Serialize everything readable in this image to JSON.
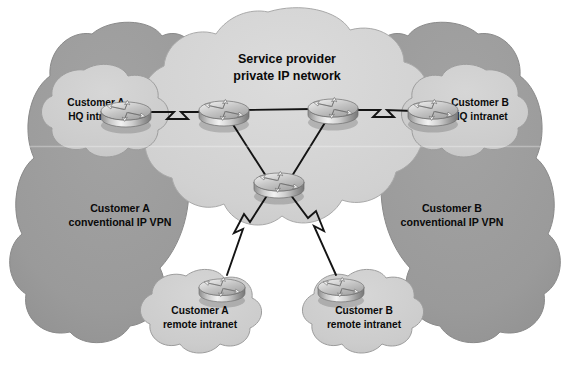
{
  "diagram": {
    "type": "network-topology",
    "title": "Service provider private IP network",
    "background_color": "#ffffff",
    "colors": {
      "service_provider_cloud": "#d2d2d2",
      "customer_vpn_cloud": "#9b9b9b",
      "site_cloud": "#cccccc",
      "cloud_outline": "#8a8a8a",
      "link": "#1a1a1a",
      "router_body": "#b8b8b8",
      "text": "#0a0a0a"
    },
    "core_cloud": {
      "name": "service-provider-cloud",
      "label_line_1": "Service provider",
      "label_line_2": "private IP network"
    },
    "vpn_zones": [
      {
        "id": "customer-a-vpn",
        "label_line_1": "Customer A",
        "label_line_2": "conventional IP VPN",
        "side": "left"
      },
      {
        "id": "customer-b-vpn",
        "label_line_1": "Customer B",
        "label_line_2": "conventional IP VPN",
        "side": "right"
      }
    ],
    "sites": [
      {
        "id": "customer-a-hq",
        "label_line_1": "Customer A",
        "label_line_2": "HQ intranet",
        "position": "top-left"
      },
      {
        "id": "customer-b-hq",
        "label_line_1": "Customer B",
        "label_line_2": "HQ intranet",
        "position": "top-right"
      },
      {
        "id": "customer-a-remote",
        "label_line_1": "Customer A",
        "label_line_2": "remote intranet",
        "position": "bottom-left"
      },
      {
        "id": "customer-b-remote",
        "label_line_1": "Customer B",
        "label_line_2": "remote intranet",
        "position": "bottom-right"
      }
    ],
    "routers": [
      {
        "id": "router-customer-a-hq",
        "x": 126,
        "y": 113,
        "scale": 1.0
      },
      {
        "id": "router-core-left",
        "x": 224,
        "y": 114,
        "scale": 1.0
      },
      {
        "id": "router-core-right",
        "x": 333,
        "y": 112,
        "scale": 1.0
      },
      {
        "id": "router-customer-b-hq",
        "x": 433,
        "y": 113,
        "scale": 1.0
      },
      {
        "id": "router-core-bottom",
        "x": 279,
        "y": 184,
        "scale": 1.0
      },
      {
        "id": "router-customer-a-remote",
        "x": 222,
        "y": 290,
        "scale": 0.92
      },
      {
        "id": "router-customer-b-remote",
        "x": 341,
        "y": 290,
        "scale": 0.92
      }
    ],
    "links": [
      {
        "id": "link-a-hq-to-core-left",
        "from": "router-customer-a-hq",
        "to": "router-core-left",
        "style": "zigzag"
      },
      {
        "id": "link-core-left-to-core-right",
        "from": "router-core-left",
        "to": "router-core-right",
        "style": "straight"
      },
      {
        "id": "link-core-right-to-b-hq",
        "from": "router-core-right",
        "to": "router-customer-b-hq",
        "style": "zigzag"
      },
      {
        "id": "link-core-left-to-core-bottom",
        "from": "router-core-left",
        "to": "router-core-bottom",
        "style": "straight"
      },
      {
        "id": "link-core-right-to-core-bottom",
        "from": "router-core-right",
        "to": "router-core-bottom",
        "style": "straight"
      },
      {
        "id": "link-core-bottom-to-a-remote",
        "from": "router-core-bottom",
        "to": "router-customer-a-remote",
        "style": "zigzag"
      },
      {
        "id": "link-core-bottom-to-b-remote",
        "from": "router-core-bottom",
        "to": "router-customer-b-remote",
        "style": "zigzag"
      }
    ]
  }
}
